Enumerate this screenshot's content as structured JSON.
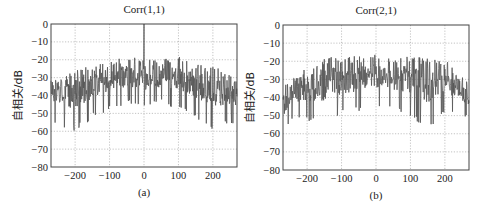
{
  "figure": {
    "width": 487,
    "height": 215,
    "background": "#ffffff",
    "trace_color": "#555555",
    "grid_color": "#9a9a9a"
  },
  "chart_data": [
    {
      "type": "line",
      "panel_id": "a",
      "title": "Corr(1,1)",
      "caption": "(a)",
      "xlabel": "",
      "ylabel": "自相关/dB",
      "xlim": [
        -270,
        270
      ],
      "ylim": [
        -80,
        0
      ],
      "xticks": [
        -200,
        -100,
        0,
        100,
        200
      ],
      "xtick_labels": [
        "−200",
        "−100",
        "0",
        "100",
        "200"
      ],
      "yticks": [
        0,
        -10,
        -20,
        -30,
        -40,
        -50,
        -60,
        -70,
        -80
      ],
      "ytick_labels": [
        "0",
        "−10",
        "−20",
        "−30",
        "−40",
        "−50",
        "−60",
        "−70",
        "−80"
      ],
      "grid": true,
      "description": "Autocorrelation magnitude in dB vs lag; sharp peak of 0 dB at lag 0, sidelobe floor roughly −25 to −35 dB near center, decaying to about −35 to −50 dB at edges, dips down to about −57 dB",
      "peak": {
        "x": 0,
        "y": 0
      },
      "envelope": [
        {
          "x": -270,
          "y_upper": -35,
          "y_lower": -52
        },
        {
          "x": -200,
          "y_upper": -30,
          "y_lower": -57
        },
        {
          "x": -150,
          "y_upper": -27,
          "y_lower": -50
        },
        {
          "x": -100,
          "y_upper": -24,
          "y_lower": -45
        },
        {
          "x": -50,
          "y_upper": -22,
          "y_lower": -42
        },
        {
          "x": 0,
          "y_upper": -24,
          "y_lower": -44
        },
        {
          "x": 50,
          "y_upper": -24,
          "y_lower": -42
        },
        {
          "x": 100,
          "y_upper": -22,
          "y_lower": -45
        },
        {
          "x": 150,
          "y_upper": -26,
          "y_lower": -50
        },
        {
          "x": 200,
          "y_upper": -27,
          "y_lower": -57
        },
        {
          "x": 270,
          "y_upper": -35,
          "y_lower": -52
        }
      ],
      "seed": 17
    },
    {
      "type": "line",
      "panel_id": "b",
      "title": "Corr(2,1)",
      "caption": "(b)",
      "xlabel": "",
      "ylabel": "自相关/dB",
      "xlim": [
        -270,
        270
      ],
      "ylim": [
        -80,
        0
      ],
      "xticks": [
        -200,
        -100,
        0,
        100,
        200
      ],
      "xtick_labels": [
        "−200",
        "−100",
        "0",
        "100",
        "200"
      ],
      "yticks": [
        0,
        -10,
        -20,
        -30,
        -40,
        -50,
        -60,
        -70,
        -80
      ],
      "ytick_labels": [
        "0",
        "−10",
        "−20",
        "−30",
        "−40",
        "−50",
        "−60",
        "−70",
        "−80"
      ],
      "grid": true,
      "description": "Cross-correlation magnitude in dB vs lag; no dominant peak, noise floor around −20 to −35 dB in center, falling to about −40 to −55 dB at the left edge, dips to about −55 dB",
      "peak": null,
      "envelope": [
        {
          "x": -270,
          "y_upper": -38,
          "y_lower": -56
        },
        {
          "x": -230,
          "y_upper": -32,
          "y_lower": -48
        },
        {
          "x": -200,
          "y_upper": -27,
          "y_lower": -50
        },
        {
          "x": -150,
          "y_upper": -22,
          "y_lower": -53
        },
        {
          "x": -100,
          "y_upper": -21,
          "y_lower": -47
        },
        {
          "x": -50,
          "y_upper": -21,
          "y_lower": -45
        },
        {
          "x": 0,
          "y_upper": -20,
          "y_lower": -42
        },
        {
          "x": 50,
          "y_upper": -22,
          "y_lower": -44
        },
        {
          "x": 100,
          "y_upper": -21,
          "y_lower": -47
        },
        {
          "x": 150,
          "y_upper": -22,
          "y_lower": -55
        },
        {
          "x": 200,
          "y_upper": -23,
          "y_lower": -45
        },
        {
          "x": 270,
          "y_upper": -36,
          "y_lower": -48
        }
      ],
      "seed": 42
    }
  ],
  "layout": {
    "panels": [
      {
        "frame": {
          "x": 51,
          "y": 24,
          "w": 186,
          "h": 143
        },
        "title_y": 13,
        "caption_y": 196,
        "ylabel_x": 22
      },
      {
        "frame": {
          "x": 283,
          "y": 25,
          "w": 186,
          "h": 145
        },
        "title_y": 14,
        "caption_y": 199,
        "ylabel_x": 254
      }
    ]
  }
}
